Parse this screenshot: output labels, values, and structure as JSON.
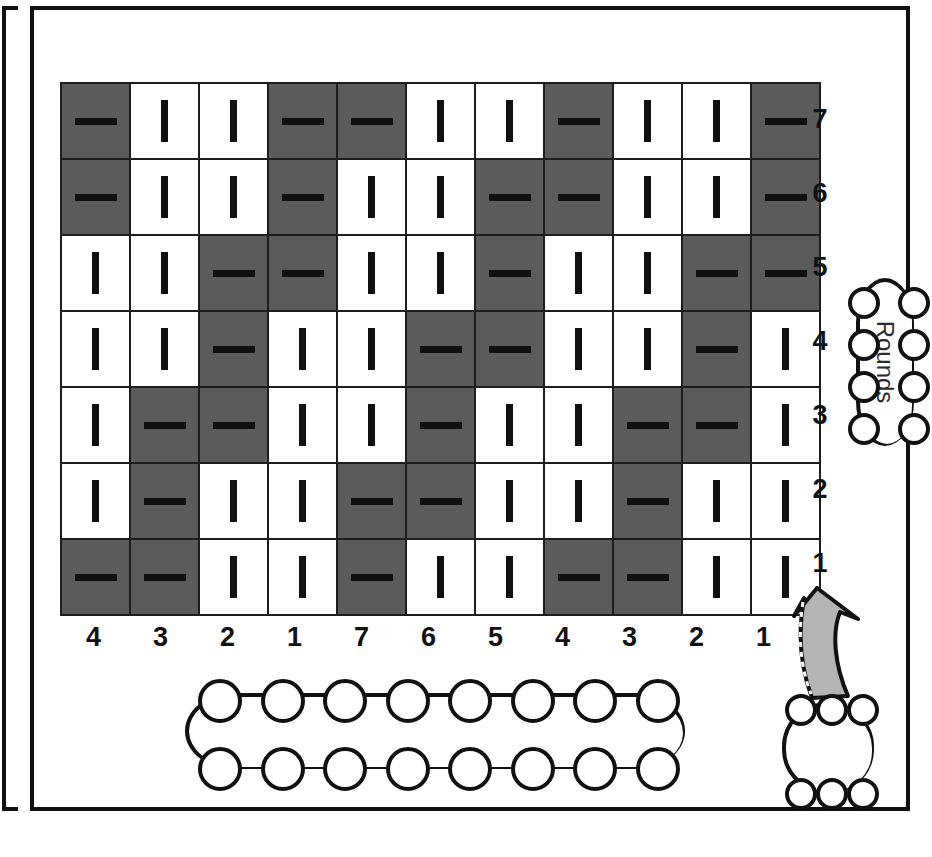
{
  "chart_data": {
    "type": "table",
    "xlabel": "Stitches",
    "ylabel": "Rounds",
    "rows": 7,
    "columns": 11,
    "legend": [
      {
        "symbol": "|",
        "name": "knit",
        "cell_color": "#ffffff"
      },
      {
        "symbol": "—",
        "name": "purl",
        "cell_color": "#5b5b5b"
      }
    ],
    "row_labels": [
      "7",
      "6",
      "5",
      "4",
      "3",
      "2",
      "1"
    ],
    "column_labels": [
      "4",
      "3",
      "2",
      "1",
      "7",
      "6",
      "5",
      "4",
      "3",
      "2",
      "1"
    ],
    "grid": [
      [
        "purl",
        "knit",
        "knit",
        "purl",
        "purl",
        "knit",
        "knit",
        "purl",
        "knit",
        "knit",
        "purl"
      ],
      [
        "purl",
        "knit",
        "knit",
        "purl",
        "knit",
        "knit",
        "purl",
        "purl",
        "knit",
        "knit",
        "purl"
      ],
      [
        "knit",
        "knit",
        "purl",
        "purl",
        "knit",
        "knit",
        "purl",
        "knit",
        "knit",
        "purl",
        "purl"
      ],
      [
        "knit",
        "knit",
        "purl",
        "knit",
        "knit",
        "purl",
        "purl",
        "knit",
        "knit",
        "purl",
        "knit"
      ],
      [
        "knit",
        "purl",
        "purl",
        "knit",
        "knit",
        "purl",
        "knit",
        "knit",
        "purl",
        "purl",
        "knit"
      ],
      [
        "knit",
        "purl",
        "knit",
        "knit",
        "purl",
        "purl",
        "knit",
        "knit",
        "purl",
        "knit",
        "knit"
      ],
      [
        "purl",
        "purl",
        "knit",
        "knit",
        "purl",
        "knit",
        "knit",
        "purl",
        "purl",
        "knit",
        "knit"
      ]
    ],
    "symbols": {
      "knit": "|",
      "purl": "—"
    }
  },
  "annotations": {
    "rounds_label": "Rounds",
    "caption": "Stitches: a multiple of 7 plus 4",
    "start_line1": "Start",
    "start_line2": "here!"
  },
  "colors": {
    "purl_cell": "#5b5b5b",
    "knit_cell": "#ffffff",
    "grid_line": "#1d1d1d",
    "ink": "#111111",
    "arrow_fill": "#b4b4b4"
  }
}
